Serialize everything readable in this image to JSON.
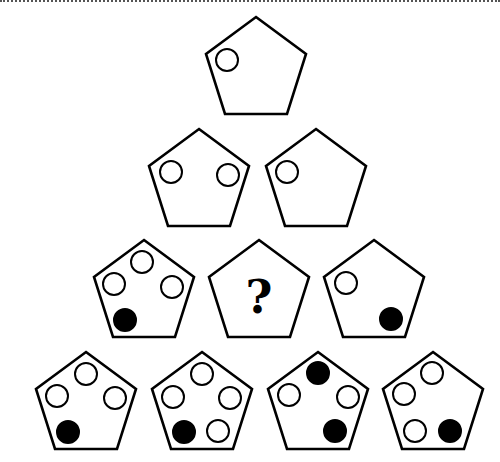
{
  "puzzle": {
    "description": "Pyramid of pentagons containing white and black circles; one pentagon marked with a question mark",
    "colors": {
      "stroke": "#000000",
      "white_circle": "#ffffff",
      "black_circle": "#000000",
      "background": "#ffffff"
    },
    "question_mark": "?",
    "circle_radius": 11,
    "rows": [
      [
        {
          "apex": [
            256,
            17
          ],
          "circles": [
            {
              "x": 227,
              "y": 60,
              "fill": "white"
            }
          ]
        }
      ],
      [
        {
          "apex": [
            199,
            129
          ],
          "circles": [
            {
              "x": 171,
              "y": 172,
              "fill": "white"
            },
            {
              "x": 228,
              "y": 175,
              "fill": "white"
            }
          ]
        },
        {
          "apex": [
            316,
            129
          ],
          "circles": [
            {
              "x": 287,
              "y": 172,
              "fill": "white"
            }
          ]
        }
      ],
      [
        {
          "apex": [
            144,
            240
          ],
          "circles": [
            {
              "x": 142,
              "y": 262,
              "fill": "white"
            },
            {
              "x": 114,
              "y": 284,
              "fill": "white"
            },
            {
              "x": 172,
              "y": 287,
              "fill": "white"
            },
            {
              "x": 125,
              "y": 320,
              "fill": "black"
            }
          ]
        },
        {
          "apex": [
            259,
            240
          ],
          "question": true,
          "circles": []
        },
        {
          "apex": [
            374,
            240
          ],
          "circles": [
            {
              "x": 346,
              "y": 283,
              "fill": "white"
            },
            {
              "x": 391,
              "y": 319,
              "fill": "black"
            }
          ]
        }
      ],
      [
        {
          "apex": [
            86,
            352
          ],
          "circles": [
            {
              "x": 86,
              "y": 374,
              "fill": "white"
            },
            {
              "x": 57,
              "y": 396,
              "fill": "white"
            },
            {
              "x": 115,
              "y": 398,
              "fill": "white"
            },
            {
              "x": 68,
              "y": 432,
              "fill": "black"
            }
          ]
        },
        {
          "apex": [
            202,
            352
          ],
          "circles": [
            {
              "x": 202,
              "y": 374,
              "fill": "white"
            },
            {
              "x": 173,
              "y": 397,
              "fill": "white"
            },
            {
              "x": 230,
              "y": 398,
              "fill": "white"
            },
            {
              "x": 184,
              "y": 432,
              "fill": "black"
            },
            {
              "x": 218,
              "y": 431,
              "fill": "white"
            }
          ]
        },
        {
          "apex": [
            318,
            352
          ],
          "circles": [
            {
              "x": 318,
              "y": 373,
              "fill": "black"
            },
            {
              "x": 289,
              "y": 395,
              "fill": "white"
            },
            {
              "x": 348,
              "y": 397,
              "fill": "white"
            },
            {
              "x": 335,
              "y": 431,
              "fill": "black"
            }
          ]
        },
        {
          "apex": [
            433,
            352
          ],
          "circles": [
            {
              "x": 432,
              "y": 373,
              "fill": "white"
            },
            {
              "x": 404,
              "y": 394,
              "fill": "white"
            },
            {
              "x": 415,
              "y": 431,
              "fill": "white"
            },
            {
              "x": 450,
              "y": 431,
              "fill": "black"
            }
          ]
        }
      ]
    ]
  }
}
